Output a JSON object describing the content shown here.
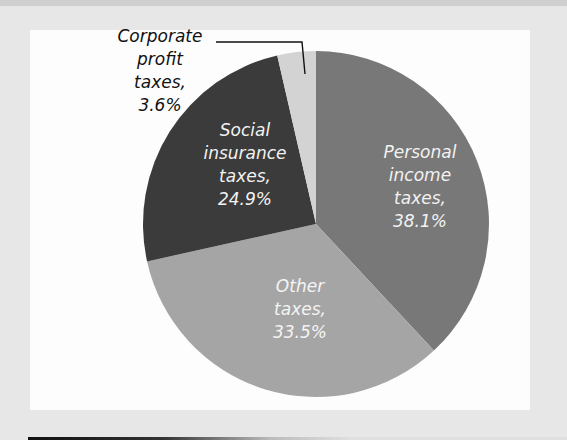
{
  "chart_data": {
    "type": "pie",
    "title": "",
    "categories": [
      "Personal income taxes",
      "Other taxes",
      "Social insurance taxes",
      "Corporate profit taxes"
    ],
    "values": [
      38.1,
      33.5,
      24.9,
      3.6
    ],
    "unit": "%",
    "start_angle_deg": 0,
    "direction": "clockwise",
    "colors": [
      "#787878",
      "#a5a5a5",
      "#3b3b3b",
      "#d3d3d3"
    ],
    "labels": [
      {
        "lines": [
          "Personal",
          "income",
          "taxes,",
          "38.1%"
        ],
        "color": "#f2f2f2",
        "position": "inside"
      },
      {
        "lines": [
          "Other",
          "taxes,",
          "33.5%"
        ],
        "color": "#f4f4f4",
        "position": "inside"
      },
      {
        "lines": [
          "Social",
          "insurance",
          "taxes,",
          "24.9%"
        ],
        "color": "#f2f2f2",
        "position": "inside"
      },
      {
        "lines": [
          "Corporate",
          "profit",
          "taxes,",
          "3.6%"
        ],
        "color": "#111111",
        "position": "outside-with-leader"
      }
    ],
    "legend": "none",
    "grid": false
  }
}
